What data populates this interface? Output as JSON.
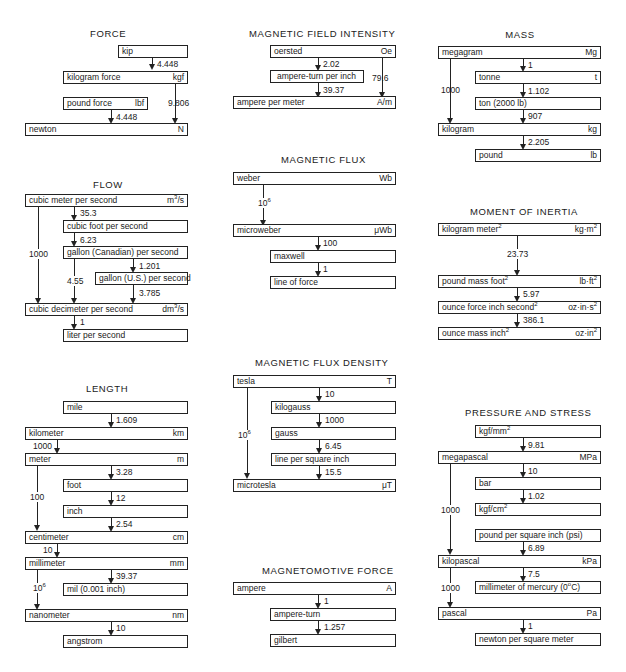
{
  "sections": {
    "force": {
      "title": "FORCE",
      "units": [
        {
          "name": "kip",
          "symbol": ""
        },
        {
          "name": "kilogram force",
          "symbol": "kgf"
        },
        {
          "name": "pound force",
          "symbol": "lbf"
        },
        {
          "name": "newton",
          "symbol": "N"
        }
      ],
      "factors": [
        "4.448",
        "9.806",
        "4.448"
      ]
    },
    "magnetic_field_intensity": {
      "title": "MAGNETIC FIELD INTENSITY",
      "units": [
        {
          "name": "oersted",
          "symbol": "Oe"
        },
        {
          "name": "ampere-turn per inch",
          "symbol": ""
        },
        {
          "name": "ampere per meter",
          "symbol": "A/m"
        }
      ],
      "factors": [
        "2.02",
        "79.6",
        "39.37"
      ]
    },
    "mass": {
      "title": "MASS",
      "units": [
        {
          "name": "megagram",
          "symbol": "Mg"
        },
        {
          "name": "tonne",
          "symbol": "t"
        },
        {
          "name": "ton (2000 lb)",
          "symbol": ""
        },
        {
          "name": "kilogram",
          "symbol": "kg"
        },
        {
          "name": "pound",
          "symbol": "lb"
        }
      ],
      "factors": [
        "1",
        "1000",
        "1.102",
        "907",
        "2.205"
      ]
    },
    "magnetic_flux": {
      "title": "MAGNETIC FLUX",
      "units": [
        {
          "name": "weber",
          "symbol": "Wb"
        },
        {
          "name": "microweber",
          "symbol": "μWb"
        },
        {
          "name": "maxwell",
          "symbol": ""
        },
        {
          "name": "line of force",
          "symbol": ""
        }
      ],
      "factors": [
        "10",
        "6",
        "100",
        "1"
      ]
    },
    "flow": {
      "title": "FLOW",
      "units": [
        {
          "name": "cubic meter per second",
          "symbol": "m",
          "sup": "3",
          "symbol_tail": "/s"
        },
        {
          "name": "cubic foot per second",
          "symbol": ""
        },
        {
          "name": "gallon (Canadian) per second",
          "symbol": ""
        },
        {
          "name": "gallon (U.S.) per second",
          "symbol": ""
        },
        {
          "name": "cubic decimeter per second",
          "symbol": "dm",
          "sup": "3",
          "symbol_tail": "/s"
        },
        {
          "name": "liter per second",
          "symbol": ""
        }
      ],
      "factors": [
        "35.3",
        "6.23",
        "1000",
        "1.201",
        "4.55",
        "3.785",
        "1"
      ]
    },
    "moment_of_inertia": {
      "title": "MOMENT OF INERTIA",
      "units": [
        {
          "name": "kilogram meter",
          "sup": "2",
          "symbol": "kg·m",
          "symbol_sup": "2"
        },
        {
          "name": "pound mass foot",
          "sup": "2",
          "symbol": "lb·ft",
          "symbol_sup": "2"
        },
        {
          "name": "ounce force inch second",
          "sup": "2",
          "symbol": "oz·in·s",
          "symbol_sup": "2"
        },
        {
          "name": "ounce mass inch",
          "sup": "2",
          "symbol": "oz·in",
          "symbol_sup": "2"
        }
      ],
      "factors": [
        "23.73",
        "5.97",
        "386.1"
      ]
    },
    "length": {
      "title": "LENGTH",
      "units": [
        {
          "name": "mile",
          "symbol": ""
        },
        {
          "name": "kilometer",
          "symbol": "km"
        },
        {
          "name": "meter",
          "symbol": "m"
        },
        {
          "name": "foot",
          "symbol": ""
        },
        {
          "name": "inch",
          "symbol": ""
        },
        {
          "name": "centimeter",
          "symbol": "cm"
        },
        {
          "name": "millimeter",
          "symbol": "mm"
        },
        {
          "name": "mil (0.001 inch)",
          "symbol": ""
        },
        {
          "name": "nanometer",
          "symbol": "nm"
        },
        {
          "name": "angstrom",
          "symbol": ""
        }
      ],
      "factors": [
        "1.609",
        "1000",
        "3.28",
        "100",
        "12",
        "2.54",
        "10",
        "39.37",
        "10",
        "6",
        "10"
      ]
    },
    "magnetic_flux_density": {
      "title": "MAGNETIC FLUX DENSITY",
      "units": [
        {
          "name": "tesla",
          "symbol": "T"
        },
        {
          "name": "kilogauss",
          "symbol": ""
        },
        {
          "name": "gauss",
          "symbol": ""
        },
        {
          "name": "line per square inch",
          "symbol": ""
        },
        {
          "name": "microtesla",
          "symbol": "μT"
        }
      ],
      "factors": [
        "10",
        "1000",
        "10",
        "6",
        "6.45",
        "15.5"
      ]
    },
    "magnetomotive_force": {
      "title": "MAGNETOMOTIVE FORCE",
      "units": [
        {
          "name": "ampere",
          "symbol": "A"
        },
        {
          "name": "ampere-turn",
          "symbol": ""
        },
        {
          "name": "gilbert",
          "symbol": ""
        }
      ],
      "factors": [
        "1",
        "1.257"
      ]
    },
    "pressure_and_stress": {
      "title": "PRESSURE AND STRESS",
      "units": [
        {
          "name": "kgf/mm",
          "sup": "2",
          "symbol": ""
        },
        {
          "name": "megapascal",
          "symbol": "MPa"
        },
        {
          "name": "bar",
          "symbol": ""
        },
        {
          "name": "kgf/cm",
          "sup": "2",
          "symbol": ""
        },
        {
          "name": "pound per square inch (psi)",
          "symbol": ""
        },
        {
          "name": "kilopascal",
          "symbol": "kPa"
        },
        {
          "name": "millimeter of mercury (0",
          "sup": "o",
          "name_tail": "C)",
          "symbol": ""
        },
        {
          "name": "pascal",
          "symbol": "Pa"
        },
        {
          "name": "newton per square meter",
          "symbol": ""
        }
      ],
      "factors": [
        "9.81",
        "10",
        "1.02",
        "1000",
        "6.89",
        "7.5",
        "1000",
        "1"
      ]
    }
  }
}
